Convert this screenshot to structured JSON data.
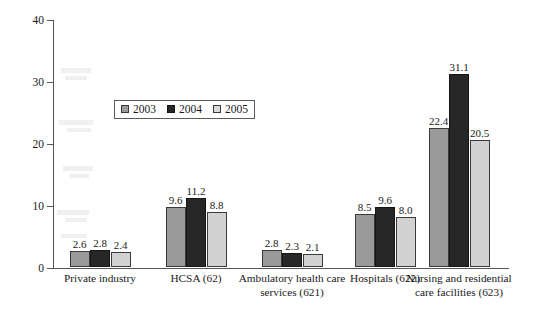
{
  "chart_data": {
    "type": "bar",
    "title": "",
    "subtitle": "",
    "xlabel": "",
    "ylabel": "Rate per 10,000 workers",
    "ylim": [
      0,
      40
    ],
    "yticks": [
      0,
      10,
      20,
      30,
      40
    ],
    "ytick_labels": [
      "0",
      "10",
      "20",
      "30",
      "40"
    ],
    "grid": false,
    "legend_position": "upper-left-inside",
    "categories": [
      "Private industry",
      "HCSA (62)",
      "Ambulatory health care services (621)",
      "Hospitals (622)",
      "Nursing and residential care facilities (623)"
    ],
    "category_lines": [
      [
        "Private industry"
      ],
      [
        "HCSA (62)"
      ],
      [
        "Ambulatory health care",
        "services (621)"
      ],
      [
        "Hospitals (622)"
      ],
      [
        "Nursing and residential",
        "care facilities (623)"
      ]
    ],
    "series": [
      {
        "name": "2003",
        "color": "#9a9a9a",
        "values": [
          2.6,
          9.6,
          2.8,
          8.5,
          22.4
        ]
      },
      {
        "name": "2004",
        "color": "#272727",
        "values": [
          2.8,
          11.2,
          2.3,
          9.6,
          31.1
        ]
      },
      {
        "name": "2005",
        "color": "#d2d2d2",
        "values": [
          2.4,
          8.8,
          2.1,
          8.0,
          20.5
        ]
      }
    ],
    "data_labels": [
      [
        "2.6",
        "2.8",
        "2.4"
      ],
      [
        "9.6",
        "11.2",
        "8.8"
      ],
      [
        "2.8",
        "2.3",
        "2.1"
      ],
      [
        "8.5",
        "9.6",
        "8.0"
      ],
      [
        "22.4",
        "31.1",
        "20.5"
      ]
    ]
  },
  "legend": {
    "entries": [
      {
        "label": "2003"
      },
      {
        "label": "2004"
      },
      {
        "label": "2005"
      }
    ]
  }
}
